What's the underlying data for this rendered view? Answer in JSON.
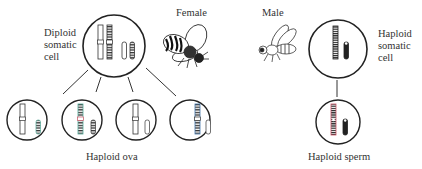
{
  "labels": {
    "diploid_cell": [
      "Diploid",
      "somatic",
      "cell"
    ],
    "female": "Female",
    "male": "Male",
    "haploid_cell": [
      "Haploid",
      "somatic",
      "cell"
    ],
    "haploid_ova": "Haploid ova",
    "haploid_sperm": "Haploid sperm"
  },
  "icons": {
    "female_bee": "female-bee-illustration",
    "male_bee": "male-bee-illustration"
  },
  "colors": {
    "line": "#333333",
    "background": "#ffffff",
    "chromosome_dark": "#222222",
    "band_accent_green": "#7fbf9a",
    "band_accent_red": "#d05a6a"
  }
}
